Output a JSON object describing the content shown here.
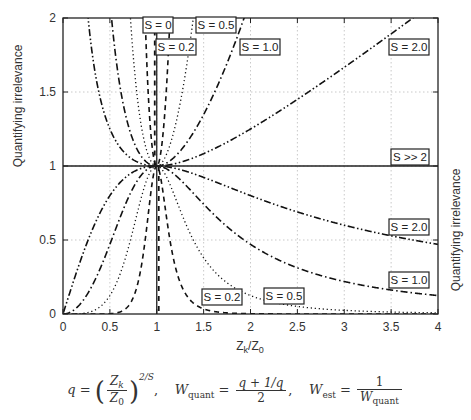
{
  "chart_data": {
    "type": "line",
    "title": "",
    "xlabel": "Z_k/Z_0",
    "ylabel": "Quantifying irrelevance",
    "ylabel_right": "Quantifying irrelevance",
    "xlim": [
      0,
      4
    ],
    "ylim": [
      0,
      2
    ],
    "grid": true,
    "xticks": [
      "0",
      "0.5",
      "1",
      "1.5",
      "2",
      "2.5",
      "3",
      "3.5",
      "4"
    ],
    "yticks": [
      "0",
      "0.5",
      "1",
      "1.5",
      "2"
    ],
    "formula": "q = (Z_k/Z_0)^(2/S), W_quant = (q + 1/q)/2, W_est = 1/W_quant",
    "series": [
      {
        "name": "S = 0",
        "S": 0,
        "style": "dashed-heavy",
        "description": "vertical at x=1"
      },
      {
        "name": "S = 0.2",
        "S": 0.2,
        "style": "dashed",
        "upper_label": [
          176,
          47
        ],
        "lower_label": [
          223,
          297
        ]
      },
      {
        "name": "S = 0.5",
        "S": 0.5,
        "style": "dotted",
        "upper_label": [
          216,
          25
        ],
        "lower_label": [
          284,
          296
        ]
      },
      {
        "name": "S = 1.0",
        "S": 1.0,
        "style": "dashdot",
        "upper_label": [
          260,
          47
        ],
        "lower_label": [
          409,
          280
        ]
      },
      {
        "name": "S = 2.0",
        "S": 2.0,
        "style": "dashdotdot",
        "upper_label": [
          409,
          47
        ],
        "lower_label": [
          409,
          227
        ]
      },
      {
        "name": "S >> 2",
        "S": "inf",
        "style": "solid",
        "value": 1.0,
        "label": [
          409,
          157
        ]
      }
    ],
    "sample_points": {
      "S=1.0_upper": {
        "x": [
          0.5,
          1,
          2,
          3,
          4
        ],
        "y": [
          1.25,
          1.0,
          1.25,
          1.667,
          2.125
        ]
      },
      "S=1.0_lower": {
        "x": [
          0.5,
          1,
          2,
          3,
          4
        ],
        "y": [
          0.8,
          1.0,
          0.8,
          0.6,
          0.47
        ]
      },
      "S=2.0_upper": {
        "x": [
          0.5,
          1,
          2,
          3,
          4
        ],
        "y": [
          1.25,
          1.0,
          1.25,
          1.667,
          2.125
        ]
      },
      "S=2.0_lower": {
        "x": [
          1,
          2,
          3,
          4
        ],
        "y": [
          1.0,
          0.8,
          0.6,
          0.47
        ]
      }
    }
  },
  "labels": {
    "s0": "S = 0",
    "s02_top": "S = 0.2",
    "s05_top": "S = 0.5",
    "s10_top": "S = 1.0",
    "s20_top": "S = 2.0",
    "sinf": "S >> 2",
    "s20_bot": "S = 2.0",
    "s10_bot": "S = 1.0",
    "s05_bot": "S = 0.5",
    "s02_bot": "S = 0.2"
  },
  "axes": {
    "xlabel": "Z",
    "xlabel_sub_k": "k",
    "xlabel_slash": "/Z",
    "xlabel_sub_0": "0",
    "ylabel": "Quantifying irrelevance",
    "ylabel_right": "Quantifying irrelevance"
  },
  "formula": {
    "q": "q",
    "eq": " = ",
    "zk": "Z",
    "zk_sub": "k",
    "z0": "Z",
    "z0_sub": "0",
    "exp": "2/S",
    "wq": "W",
    "wq_sub": "quant",
    "wq_num": "q + 1/q",
    "wq_den": "2",
    "we": "W",
    "we_sub": "est",
    "we_num": "1",
    "we_den_w": "W",
    "we_den_sub": "quant"
  }
}
